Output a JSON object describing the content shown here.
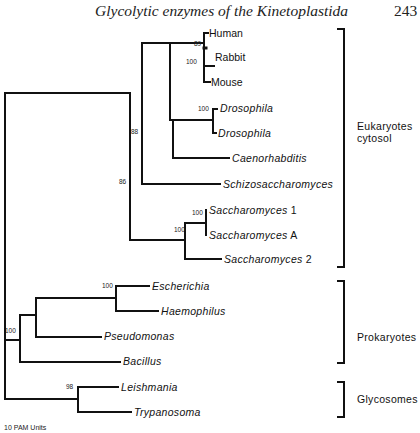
{
  "header": {
    "title": "Glycolytic enzymes of the Kinetoplastida",
    "page_number": "243"
  },
  "tree": {
    "leaves": [
      {
        "name": "Human",
        "suffix": "",
        "italic": false,
        "x": 209,
        "y": 33
      },
      {
        "name": "Rabbit",
        "suffix": "",
        "italic": false,
        "x": 215,
        "y": 57
      },
      {
        "name": "Mouse",
        "suffix": "",
        "italic": false,
        "x": 211,
        "y": 82
      },
      {
        "name": "Drosophila",
        "suffix": "",
        "italic": true,
        "x": 220,
        "y": 108
      },
      {
        "name": "Drosophila",
        "suffix": "",
        "italic": true,
        "x": 218,
        "y": 133
      },
      {
        "name": "Caenorhabditis",
        "suffix": "",
        "italic": true,
        "x": 232,
        "y": 158
      },
      {
        "name": "Schizosaccharomyces",
        "suffix": "",
        "italic": true,
        "x": 223,
        "y": 184
      },
      {
        "name": "Saccharomyces",
        "suffix": " 1",
        "italic": true,
        "x": 209,
        "y": 210
      },
      {
        "name": "Saccharomyces",
        "suffix": " A",
        "italic": true,
        "x": 209,
        "y": 235
      },
      {
        "name": "Saccharomyces",
        "suffix": " 2",
        "italic": true,
        "x": 224,
        "y": 259
      },
      {
        "name": "Escherichia",
        "suffix": "",
        "italic": true,
        "x": 152,
        "y": 286
      },
      {
        "name": "Haemophilus",
        "suffix": "",
        "italic": true,
        "x": 161,
        "y": 311
      },
      {
        "name": "Pseudomonas",
        "suffix": "",
        "italic": true,
        "x": 104,
        "y": 336
      },
      {
        "name": "Bacillus",
        "suffix": "",
        "italic": true,
        "x": 123,
        "y": 361
      },
      {
        "name": "Leishmania",
        "suffix": "",
        "italic": true,
        "x": 121,
        "y": 387
      },
      {
        "name": "Trypanosoma",
        "suffix": "",
        "italic": true,
        "x": 134,
        "y": 412
      }
    ],
    "bootstrap": [
      {
        "value": "89",
        "x": 194,
        "y": 48
      },
      {
        "value": "100",
        "x": 186,
        "y": 66
      },
      {
        "value": "100",
        "x": 198,
        "y": 113
      },
      {
        "value": "88",
        "x": 131,
        "y": 136
      },
      {
        "value": "86",
        "x": 119,
        "y": 186
      },
      {
        "value": "100",
        "x": 192,
        "y": 217
      },
      {
        "value": "100",
        "x": 174,
        "y": 234
      },
      {
        "value": "100",
        "x": 102,
        "y": 290
      },
      {
        "value": "100",
        "x": 5,
        "y": 335
      },
      {
        "value": "98",
        "x": 66,
        "y": 391
      }
    ],
    "groups": [
      {
        "label_line1": "Eukaryotes",
        "label_line2": "cytosol",
        "x": 357,
        "y": 120
      },
      {
        "label_line1": "Prokaryotes",
        "label_line2": "",
        "x": 357,
        "y": 331
      },
      {
        "label_line1": "Glycosomes",
        "label_line2": "",
        "x": 357,
        "y": 393
      }
    ],
    "scale_label": "10 PAM Units"
  }
}
